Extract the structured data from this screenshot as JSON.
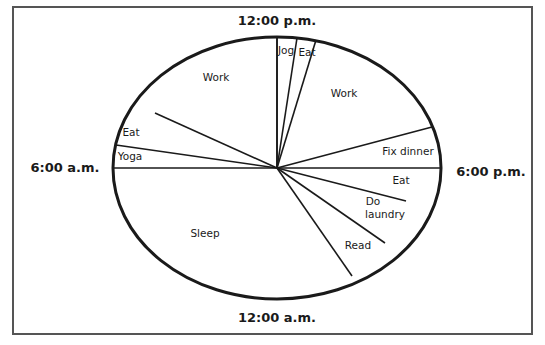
{
  "chart_data": {
    "type": "pie",
    "title": "",
    "subtitle": "24-hour daily schedule clock",
    "start_at_top": "12:00 p.m.",
    "direction": "clockwise",
    "total_hours": 24,
    "clock_labels": {
      "top": "12:00 p.m.",
      "right": "6:00 p.m.",
      "bottom": "12:00 a.m.",
      "left": "6:00 a.m."
    },
    "categories": [
      "Jog",
      "Eat",
      "Work",
      "Fix dinner",
      "Eat",
      "Do laundry",
      "Read",
      "Sleep",
      "Yoga",
      "Eat",
      "Work"
    ],
    "values": [
      0.5,
      0.5,
      4,
      1,
      1,
      1,
      2,
      8,
      1,
      1,
      4
    ],
    "slices": [
      {
        "label": "Jog",
        "start": "12:00 p.m.",
        "end": "12:30 p.m.",
        "hours": 0.5,
        "spoke_end": [
          297,
          38
        ],
        "label_pos": [
          286,
          54
        ]
      },
      {
        "label": "Eat",
        "start": "12:30 p.m.",
        "end": "1:00 p.m.",
        "hours": 0.5,
        "spoke_end": [
          316,
          40
        ],
        "label_pos": [
          307,
          56
        ]
      },
      {
        "label": "Work",
        "start": "1:00 p.m.",
        "end": "5:00 p.m.",
        "hours": 4,
        "spoke_end": [
          432,
          127
        ],
        "label_pos": [
          344,
          97
        ]
      },
      {
        "label": "Fix dinner",
        "start": "5:00 p.m.",
        "end": "6:00 p.m.",
        "hours": 1,
        "spoke_end": [
          441,
          168
        ],
        "label_pos": [
          408,
          155
        ]
      },
      {
        "label": "Eat",
        "start": "6:00 p.m.",
        "end": "7:00 p.m.",
        "hours": 1,
        "spoke_end": [
          406,
          201
        ],
        "label_pos": [
          401,
          184
        ]
      },
      {
        "label": "Do laundry",
        "start": "7:00 p.m.",
        "end": "8:00 p.m.",
        "hours": 1,
        "spoke_end": [
          385,
          243
        ],
        "label_pos": [
          385,
          205
        ],
        "label_lines": [
          "Do",
          "laundry"
        ]
      },
      {
        "label": "Read",
        "start": "8:00 p.m.",
        "end": "10:00 p.m.",
        "hours": 2,
        "spoke_end": [
          352,
          276
        ],
        "label_pos": [
          358,
          249
        ]
      },
      {
        "label": "Sleep",
        "start": "10:00 p.m.",
        "end": "6:00 a.m.",
        "hours": 8,
        "spoke_end": [
          113,
          168
        ],
        "label_pos": [
          205,
          237
        ]
      },
      {
        "label": "Yoga",
        "start": "6:00 a.m.",
        "end": "7:00 a.m.",
        "hours": 1,
        "spoke_end": [
          116,
          145
        ],
        "label_pos": [
          130,
          160
        ]
      },
      {
        "label": "Eat",
        "start": "7:00 a.m.",
        "end": "8:00 a.m.",
        "hours": 1,
        "spoke_end": [
          155,
          113
        ],
        "label_pos": [
          131,
          136
        ]
      },
      {
        "label": "Work",
        "start": "8:00 a.m.",
        "end": "12:00 p.m.",
        "hours": 4,
        "spoke_end": [
          277,
          37
        ],
        "label_pos": [
          216,
          81
        ]
      }
    ],
    "legend": "none",
    "grid": false
  }
}
